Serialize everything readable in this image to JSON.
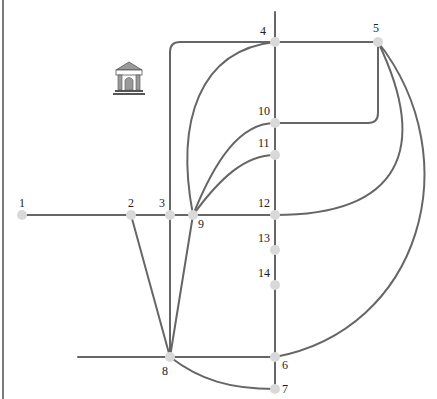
{
  "diagram": {
    "type": "network-graph",
    "colors": {
      "edge": "#666666",
      "node": "#d9d9d9",
      "label": "#222222",
      "border": "#7a7a7a"
    },
    "icon": {
      "name": "bank-building-icon",
      "meaning": "museum / bank building"
    },
    "nodes": [
      {
        "id": "1",
        "label": "1"
      },
      {
        "id": "2",
        "label": "2"
      },
      {
        "id": "3",
        "label": "3"
      },
      {
        "id": "4",
        "label": "4"
      },
      {
        "id": "5",
        "label": "5"
      },
      {
        "id": "6",
        "label": "6"
      },
      {
        "id": "7",
        "label": "7"
      },
      {
        "id": "8",
        "label": "8"
      },
      {
        "id": "9",
        "label": "9"
      },
      {
        "id": "10",
        "label": "10"
      },
      {
        "id": "11",
        "label": "11"
      },
      {
        "id": "12",
        "label": "12"
      },
      {
        "id": "13",
        "label": "13"
      },
      {
        "id": "14",
        "label": "14"
      }
    ],
    "edges": [
      [
        "1",
        "2"
      ],
      [
        "2",
        "3"
      ],
      [
        "3",
        "9"
      ],
      [
        "9",
        "12"
      ],
      [
        "2",
        "8"
      ],
      [
        "3",
        "8"
      ],
      [
        "9",
        "8"
      ],
      [
        "3",
        "4"
      ],
      [
        "4",
        "5"
      ],
      [
        "9",
        "4"
      ],
      [
        "9",
        "10"
      ],
      [
        "9",
        "11"
      ],
      [
        "4",
        "10"
      ],
      [
        "10",
        "11"
      ],
      [
        "11",
        "12"
      ],
      [
        "12",
        "13"
      ],
      [
        "13",
        "14"
      ],
      [
        "14",
        "6"
      ],
      [
        "6",
        "7"
      ],
      [
        "5",
        "10"
      ],
      [
        "5",
        "12"
      ],
      [
        "5",
        "6"
      ],
      [
        "8",
        "6"
      ],
      [
        "8",
        "7"
      ]
    ]
  }
}
